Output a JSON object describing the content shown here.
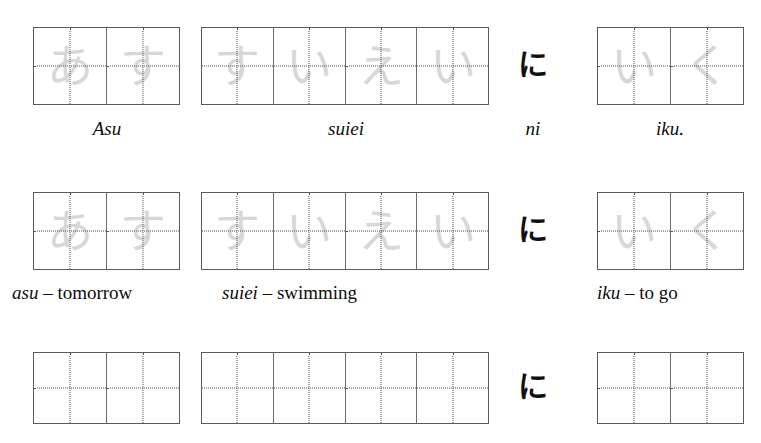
{
  "worksheet": {
    "title": "Hiragana sentence handwriting practice",
    "sentence_romaji": "Asu suiei ni iku.",
    "particle_glyph": "に",
    "particle_romaji": "ni",
    "ink_color": "#101010",
    "trace_color": "#c9c9c9",
    "grid_border_color": "#5a5a5a",
    "guide_dot_color": "#4f4f4f"
  },
  "rows": [
    {
      "id": "row-traced-sentence",
      "label": "Traced sentence with romaji reading",
      "words": [
        {
          "id": "word-asu",
          "romaji": "Asu",
          "kana": [
            "あ",
            "す"
          ],
          "traced": true
        },
        {
          "id": "word-suiei",
          "romaji": "suiei",
          "kana": [
            "す",
            "い",
            "え",
            "い"
          ],
          "traced": true
        },
        {
          "id": "word-iku",
          "romaji": "iku.",
          "kana": [
            "い",
            "く"
          ],
          "traced": true
        }
      ],
      "particle": {
        "glyph": "に",
        "romaji": "ni"
      }
    },
    {
      "id": "row-traced-vocab",
      "label": "Traced sentence with vocabulary glosses",
      "words": [
        {
          "id": "word-asu",
          "romaji": "asu",
          "separator": "–",
          "gloss": "tomorrow",
          "kana": [
            "あ",
            "す"
          ],
          "traced": true
        },
        {
          "id": "word-suiei",
          "romaji": "suiei",
          "separator": "–",
          "gloss": "swimming",
          "kana": [
            "す",
            "い",
            "え",
            "い"
          ],
          "traced": true
        },
        {
          "id": "word-iku",
          "romaji": "iku",
          "separator": "–",
          "gloss": "to go",
          "kana": [
            "い",
            "く"
          ],
          "traced": true
        }
      ],
      "particle": {
        "glyph": "に",
        "romaji": ""
      }
    },
    {
      "id": "row-blank-practice",
      "label": "Blank practice grids",
      "words": [
        {
          "id": "word-asu",
          "romaji": "",
          "kana": [
            "",
            ""
          ],
          "traced": false
        },
        {
          "id": "word-suiei",
          "romaji": "",
          "kana": [
            "",
            "",
            "",
            ""
          ],
          "traced": false
        },
        {
          "id": "word-iku",
          "romaji": "",
          "kana": [
            "",
            ""
          ],
          "traced": false
        }
      ],
      "particle": {
        "glyph": "に",
        "romaji": ""
      }
    }
  ]
}
